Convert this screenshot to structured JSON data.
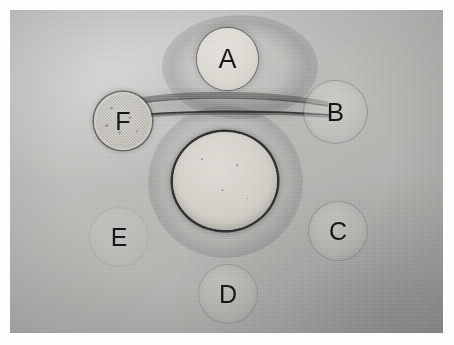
{
  "image": {
    "kind": "photograph",
    "subject": "Ouchterlony double immunodiffusion gel plate",
    "rendering": "grayscale",
    "width_px": 454,
    "height_px": 345,
    "print_border": {
      "left_px": 10,
      "top_px": 10,
      "width_px": 433,
      "height_px": 323
    },
    "background": {
      "description": "agar gel surface, even matte gray with film grain",
      "light_corner": "upper-left",
      "dark_corner": "lower-right",
      "base_color": "#bdbdba",
      "light_tone": "#c9c9c6",
      "dark_tone": "#a9a9a6"
    }
  },
  "wells": {
    "center": {
      "label": "",
      "role": "central antiserum well",
      "cx": 215,
      "cy": 171,
      "diameter_px": 104,
      "appearance": "large, bright filled disc with a distinct dark outline ring",
      "brightness": "bright",
      "outline": "strong dark ring",
      "fill_color": "#d4d2cb",
      "ring_color": "#1c1c1e"
    },
    "peripheral": [
      {
        "label": "A",
        "position": "top",
        "cx": 217,
        "cy": 49,
        "diameter_px": 61,
        "appearance": "bright well with sharp edge and a surrounding diffuse dark halo",
        "brightness": "bright",
        "outline": "soft dark edge",
        "fill_color": "#dbd9d2"
      },
      {
        "label": "B",
        "position": "upper-right",
        "cx": 325,
        "cy": 102,
        "diameter_px": 63,
        "appearance": "faint pale circle, low contrast against gel",
        "brightness": "faint",
        "outline": "thin faint ring",
        "fill_color": "#d2d0ca"
      },
      {
        "label": "C",
        "position": "lower-right",
        "cx": 328,
        "cy": 221,
        "diameter_px": 58,
        "appearance": "faint pale circle, low contrast against gel",
        "brightness": "faint",
        "outline": "thin faint ring",
        "fill_color": "#cecdc6"
      },
      {
        "label": "D",
        "position": "bottom",
        "cx": 218,
        "cy": 284,
        "diameter_px": 58,
        "appearance": "faint pale circle, lower edge near the print border",
        "brightness": "faint",
        "outline": "very thin faint ring",
        "fill_color": "#ccccc4"
      },
      {
        "label": "E",
        "position": "lower-left",
        "cx": 109,
        "cy": 227,
        "diameter_px": 58,
        "appearance": "nearly invisible against the gel; only the letter is clearly readable",
        "brightness": "very faint",
        "outline": "barely perceptible",
        "fill_color": "#cacac2"
      },
      {
        "label": "F",
        "position": "upper-left",
        "cx": 113,
        "cy": 111,
        "diameter_px": 58,
        "appearance": "speckled, granular interior with a clearly defined dark ring",
        "brightness": "medium with texture",
        "outline": "distinct dark ring",
        "fill_color": "#cdcbc4"
      }
    ]
  },
  "precipitin_lines": [
    {
      "name": "upper-arc",
      "from_well": "F",
      "to_well": "B",
      "shape": "broad shallow arc bowing downward",
      "contrast": "dark, diffuse",
      "color": "#4a4a4c"
    },
    {
      "name": "lower-arc",
      "from_well": "F",
      "to_well": "B",
      "shape": "thin sharp arc bowing downward, passing just above the central well",
      "contrast": "dark, well defined",
      "color": "#2e2e30"
    }
  ],
  "halos": [
    {
      "name": "center-halo",
      "around_well": "center",
      "description": "diffuse darker ring of precipitate surrounding the central well"
    },
    {
      "name": "a-halo",
      "around_well": "A",
      "description": "diffuse dark shading spreading laterally from well A"
    }
  ]
}
